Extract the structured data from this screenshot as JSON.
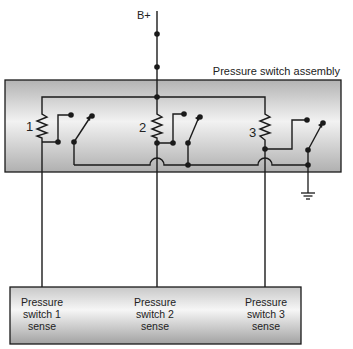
{
  "diagram": {
    "title": "Pressure switch assembly",
    "supply_label": "B+",
    "colors": {
      "wire": "#1a1a1a",
      "box_fill_light": "#f4f4f4",
      "box_fill_dark": "#a9a9a9",
      "box_stroke": "#1a1a1a"
    },
    "switches": [
      {
        "number": "1",
        "sense_label_line1": "Pressure",
        "sense_label_line2": "switch 1",
        "sense_label_line3": "sense"
      },
      {
        "number": "2",
        "sense_label_line1": "Pressure",
        "sense_label_line2": "switch 2",
        "sense_label_line3": "sense"
      },
      {
        "number": "3",
        "sense_label_line1": "Pressure",
        "sense_label_line2": "switch 3",
        "sense_label_line3": "sense"
      }
    ],
    "ground_symbol": "ground-icon"
  }
}
